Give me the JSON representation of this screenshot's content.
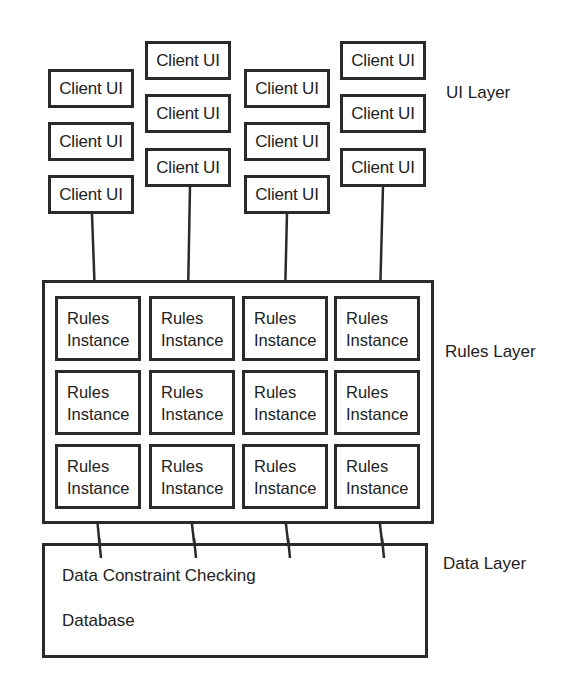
{
  "layers": {
    "ui": {
      "label": "UI Layer"
    },
    "rules": {
      "label": "Rules Layer"
    },
    "data": {
      "label": "Data Layer"
    }
  },
  "ui_layer": {
    "columns": [
      {
        "boxes": [
          "Client UI",
          "Client UI",
          "Client UI"
        ]
      },
      {
        "boxes": [
          "Client UI",
          "Client UI",
          "Client UI"
        ]
      },
      {
        "boxes": [
          "Client UI",
          "Client UI",
          "Client UI"
        ]
      },
      {
        "boxes": [
          "Client UI",
          "Client UI",
          "Client UI"
        ]
      }
    ]
  },
  "rules_layer": {
    "instance_line1": "Rules",
    "instance_line2": "Instance",
    "rows": 3,
    "columns": 4
  },
  "data_layer": {
    "items": [
      "Data Constraint Checking",
      "Database"
    ]
  },
  "colors": {
    "stroke": "#2a2a2a",
    "text": "#222222",
    "background": "#ffffff"
  }
}
